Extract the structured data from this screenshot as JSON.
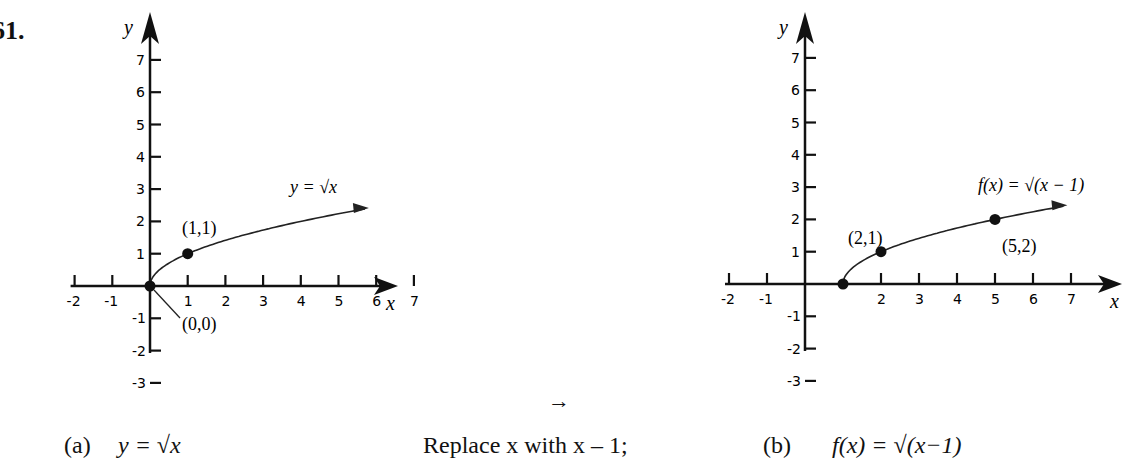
{
  "problem_number": "61.",
  "arrow_symbol": "→",
  "captions": {
    "a_label": "(a)",
    "a_eq": "y = √x",
    "middle": "Replace x with x – 1;",
    "b_label": "(b)",
    "b_eq": "f(x) = √(x−1)"
  },
  "chart_data": [
    {
      "type": "line",
      "title": "(a) y = √x",
      "xlabel": "x",
      "ylabel": "y",
      "xlim": [
        -2,
        7
      ],
      "ylim": [
        -3,
        7
      ],
      "x_ticks": [
        -2,
        -1,
        1,
        2,
        3,
        4,
        5,
        6,
        7
      ],
      "y_ticks": [
        -3,
        -2,
        -1,
        1,
        2,
        3,
        4,
        5,
        6,
        7
      ],
      "series": [
        {
          "name": "y = √x",
          "x": [
            0,
            1,
            4,
            5.7
          ],
          "y": [
            0,
            1,
            2,
            2.39
          ]
        }
      ],
      "points": [
        {
          "x": 0,
          "y": 0,
          "label": "(0,0)"
        },
        {
          "x": 1,
          "y": 1,
          "label": "(1,1)"
        }
      ],
      "curve_label": "y = √x",
      "grid": false
    },
    {
      "type": "line",
      "title": "(b) f(x) = √(x−1)",
      "xlabel": "x",
      "ylabel": "y",
      "xlim": [
        -2,
        7
      ],
      "ylim": [
        -3,
        7
      ],
      "x_ticks": [
        -2,
        -1,
        2,
        3,
        4,
        5,
        6,
        7
      ],
      "y_ticks": [
        -3,
        -2,
        -1,
        1,
        2,
        3,
        4,
        5,
        6,
        7
      ],
      "series": [
        {
          "name": "f(x) = √(x−1)",
          "x": [
            1,
            2,
            5,
            6.8
          ],
          "y": [
            0,
            1,
            2,
            2.41
          ]
        }
      ],
      "points": [
        {
          "x": 1,
          "y": 0,
          "label": ""
        },
        {
          "x": 2,
          "y": 1,
          "label": "(2,1)"
        },
        {
          "x": 5,
          "y": 2,
          "label": "(5,2)"
        }
      ],
      "curve_label": "f(x) = √(x − 1)",
      "grid": false
    }
  ]
}
